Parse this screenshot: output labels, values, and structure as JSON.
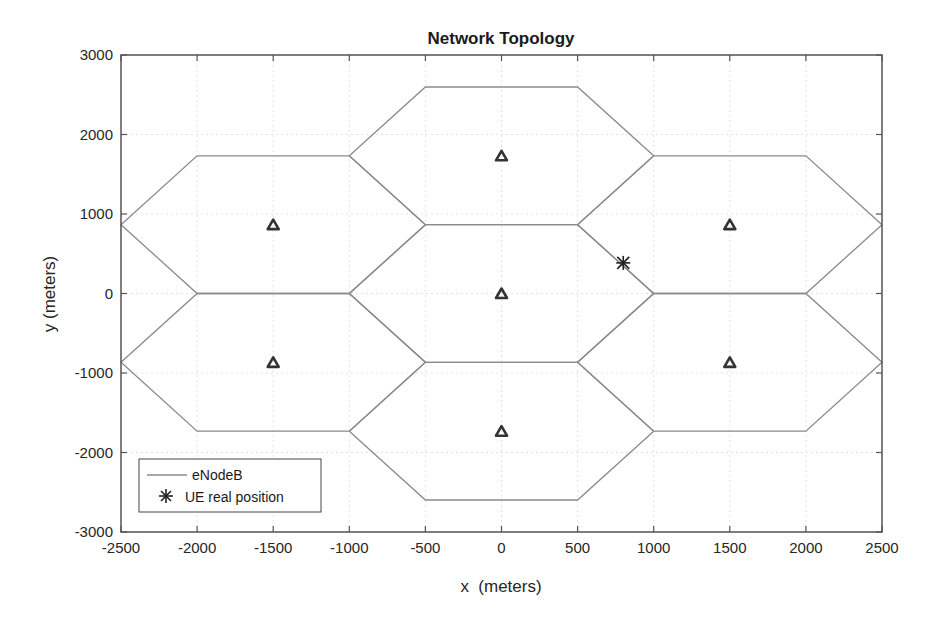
{
  "chart_data": {
    "type": "line",
    "title": "Network Topology",
    "xlabel": "x  (meters)",
    "ylabel": "y (meters)",
    "xlim": [
      -2500,
      2500
    ],
    "ylim": [
      -3000,
      3000
    ],
    "xticks": [
      -2500,
      -2000,
      -1500,
      -1000,
      -500,
      0,
      500,
      1000,
      1500,
      2000,
      2500
    ],
    "yticks": [
      -3000,
      -2000,
      -1000,
      0,
      1000,
      2000,
      3000
    ],
    "xtick_labels": [
      "-2500",
      "-2000",
      "-1500",
      "-1000",
      "-500",
      "0",
      "500",
      "1000",
      "1500",
      "2000",
      "2500"
    ],
    "ytick_labels": [
      "-3000",
      "-2000",
      "-1000",
      "0",
      "1000",
      "2000",
      "3000"
    ],
    "grid": true,
    "legend_position": "southwest",
    "legend": [
      {
        "label": "eNodeB",
        "marker": "line"
      },
      {
        "label": "UE real position",
        "marker": "asterisk"
      }
    ],
    "cell_radius": 1000,
    "enodebs": [
      {
        "x": 0,
        "y": 0
      },
      {
        "x": 0,
        "y": 1732
      },
      {
        "x": 0,
        "y": -1732
      },
      {
        "x": -1500,
        "y": 866
      },
      {
        "x": -1500,
        "y": -866
      },
      {
        "x": 1500,
        "y": 866
      },
      {
        "x": 1500,
        "y": -866
      }
    ],
    "ue_position": {
      "x": 800,
      "y": 385
    },
    "colors": {
      "hexagon": "#8a8a8a",
      "enodeb_marker": "#333333",
      "ue_marker": "#222222",
      "axes": "#555555",
      "grid": "#e3e3e3"
    }
  }
}
